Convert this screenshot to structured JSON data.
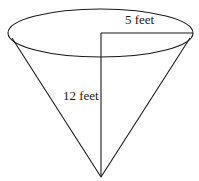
{
  "diagram": {
    "type": "cone",
    "orientation": "inverted",
    "labels": {
      "radius": "5 feet",
      "height": "12 feet"
    },
    "measurements": {
      "radius_feet": 5,
      "height_feet": 12
    },
    "colors": {
      "stroke": "#1a1a1a",
      "background": "#ffffff"
    }
  }
}
